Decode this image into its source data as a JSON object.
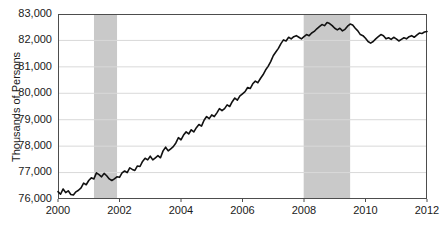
{
  "chart_data": {
    "type": "line",
    "title": "",
    "subtitle": "",
    "xlabel": "",
    "ylabel": "Thousands of Persons",
    "xlim": [
      2000,
      2012
    ],
    "ylim": [
      76000,
      83000
    ],
    "grid": true,
    "grid_axis": "y",
    "legend": "none",
    "y_ticks": [
      76000,
      77000,
      78000,
      79000,
      80000,
      81000,
      82000,
      83000
    ],
    "y_tick_labels": [
      "76,000",
      "77,000",
      "78,000",
      "79,000",
      "80,000",
      "81,000",
      "82,000",
      "83,000"
    ],
    "x_ticks": [
      2000,
      2002,
      2004,
      2006,
      2008,
      2010,
      2012
    ],
    "x_tick_labels": [
      "2000",
      "2002",
      "2004",
      "2006",
      "2008",
      "2010",
      "2012"
    ],
    "line_color": "#111111",
    "line_width": 1.6,
    "shaded_region_color": "#c9c9c9",
    "shaded_regions": [
      {
        "name": "recession-2001",
        "x0": 2001.17,
        "x1": 2001.92
      },
      {
        "name": "recession-2008",
        "x0": 2007.99,
        "x1": 2009.5
      }
    ],
    "series": [
      {
        "name": "Employment Level",
        "x": [
          2000.0,
          2000.083,
          2000.167,
          2000.25,
          2000.333,
          2000.417,
          2000.5,
          2000.583,
          2000.667,
          2000.75,
          2000.833,
          2000.917,
          2001.0,
          2001.083,
          2001.167,
          2001.25,
          2001.333,
          2001.417,
          2001.5,
          2001.583,
          2001.667,
          2001.75,
          2001.833,
          2001.917,
          2002.0,
          2002.083,
          2002.167,
          2002.25,
          2002.333,
          2002.417,
          2002.5,
          2002.583,
          2002.667,
          2002.75,
          2002.833,
          2002.917,
          2003.0,
          2003.083,
          2003.167,
          2003.25,
          2003.333,
          2003.417,
          2003.5,
          2003.583,
          2003.667,
          2003.75,
          2003.833,
          2003.917,
          2004.0,
          2004.083,
          2004.167,
          2004.25,
          2004.333,
          2004.417,
          2004.5,
          2004.583,
          2004.667,
          2004.75,
          2004.833,
          2004.917,
          2005.0,
          2005.083,
          2005.167,
          2005.25,
          2005.333,
          2005.417,
          2005.5,
          2005.583,
          2005.667,
          2005.75,
          2005.833,
          2005.917,
          2006.0,
          2006.083,
          2006.167,
          2006.25,
          2006.333,
          2006.417,
          2006.5,
          2006.583,
          2006.667,
          2006.75,
          2006.833,
          2006.917,
          2007.0,
          2007.083,
          2007.167,
          2007.25,
          2007.333,
          2007.417,
          2007.5,
          2007.583,
          2007.667,
          2007.75,
          2007.833,
          2007.917,
          2008.0,
          2008.083,
          2008.167,
          2008.25,
          2008.333,
          2008.417,
          2008.5,
          2008.583,
          2008.667,
          2008.75,
          2008.833,
          2008.917,
          2009.0,
          2009.083,
          2009.167,
          2009.25,
          2009.333,
          2009.417,
          2009.5,
          2009.583,
          2009.667,
          2009.75,
          2009.833,
          2009.917,
          2010.0,
          2010.083,
          2010.167,
          2010.25,
          2010.333,
          2010.417,
          2010.5,
          2010.583,
          2010.667,
          2010.75,
          2010.833,
          2010.917,
          2011.0,
          2011.083,
          2011.167,
          2011.25,
          2011.333,
          2011.417,
          2011.5,
          2011.583,
          2011.667,
          2011.75,
          2011.833,
          2011.917,
          2012.0
        ],
        "values": [
          76280,
          76180,
          76380,
          76240,
          76310,
          76170,
          76150,
          76270,
          76330,
          76420,
          76600,
          76540,
          76700,
          76800,
          76760,
          76990,
          76920,
          76840,
          76970,
          76880,
          76760,
          76700,
          76760,
          76840,
          76820,
          76990,
          77060,
          77000,
          77180,
          77120,
          77080,
          77250,
          77230,
          77420,
          77540,
          77480,
          77620,
          77480,
          77560,
          77640,
          77560,
          77820,
          77960,
          77820,
          77900,
          77980,
          78120,
          78320,
          78240,
          78420,
          78540,
          78460,
          78620,
          78540,
          78700,
          78820,
          78760,
          78980,
          79120,
          79040,
          79180,
          79120,
          79260,
          79420,
          79340,
          79420,
          79560,
          79500,
          79680,
          79820,
          79740,
          79900,
          79980,
          80060,
          80220,
          80180,
          80360,
          80460,
          80400,
          80560,
          80700,
          80880,
          81020,
          81200,
          81420,
          81560,
          81700,
          81880,
          82020,
          81980,
          82120,
          82060,
          82140,
          82180,
          82120,
          82060,
          82140,
          82220,
          82180,
          82280,
          82340,
          82440,
          82520,
          82600,
          82560,
          82680,
          82640,
          82560,
          82460,
          82400,
          82460,
          82360,
          82420,
          82540,
          82620,
          82580,
          82460,
          82360,
          82220,
          82180,
          82080,
          81960,
          81900,
          81960,
          82060,
          82140,
          82220,
          82180,
          82060,
          82100,
          82040,
          82120,
          82060,
          81980,
          82040,
          82100,
          82060,
          82140,
          82180,
          82120,
          82200,
          82280,
          82260,
          82320,
          82340
        ]
      }
    ]
  },
  "axes": {
    "plot_left_px": 58,
    "plot_right_px": 427,
    "plot_top_px": 14,
    "plot_bottom_px": 199,
    "frame_color": "#4d4d4d",
    "gridline_color": "#d9d9d9",
    "background": "#ffffff"
  }
}
